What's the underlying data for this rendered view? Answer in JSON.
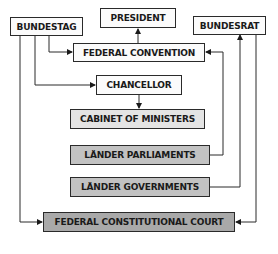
{
  "diagram": {
    "title": "",
    "nodes": {
      "president": {
        "label": "PRESIDENT",
        "fill": "#fbfbfb"
      },
      "bundestag": {
        "label": "BUNDESTAG",
        "fill": "#fbfbfb"
      },
      "bundesrat": {
        "label": "BUNDESRAT",
        "fill": "#fbfbfb"
      },
      "federal_convention": {
        "label": "FEDERAL CONVENTION",
        "fill": "#fbfbfb"
      },
      "chancellor": {
        "label": "CHANCELLOR",
        "fill": "#fbfbfb"
      },
      "cabinet": {
        "label": "CABINET OF MINISTERS",
        "fill": "#e4e4e4"
      },
      "lander_parliaments": {
        "label": "LÄNDER PARLIAMENTS",
        "fill": "#c2c2c2"
      },
      "lander_governments": {
        "label": "LÄNDER GOVERNMENTS",
        "fill": "#c2c2c2"
      },
      "constitutional_court": {
        "label": "FEDERAL CONSTITUTIONAL COURT",
        "fill": "#a9a9a9"
      }
    },
    "edges": [
      {
        "from": "bundestag",
        "to": "federal_convention"
      },
      {
        "from": "bundestag",
        "to": "chancellor"
      },
      {
        "from": "bundestag",
        "to": "constitutional_court"
      },
      {
        "from": "federal_convention",
        "to": "president"
      },
      {
        "from": "chancellor",
        "to": "cabinet"
      },
      {
        "from": "lander_parliaments",
        "to": "federal_convention"
      },
      {
        "from": "lander_governments",
        "to": "bundesrat"
      },
      {
        "from": "bundesrat",
        "to": "constitutional_court"
      }
    ]
  }
}
